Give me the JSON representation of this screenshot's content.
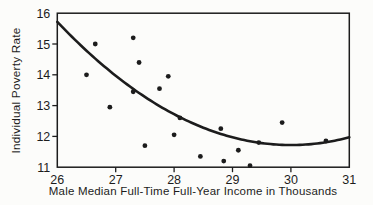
{
  "figure": {
    "background": "#fcfcfa",
    "ink": "#1c1c1c"
  },
  "chart_data": {
    "type": "scatter",
    "title": "",
    "xlabel": "Male Median Full-Time Full-Year Income in Thousands",
    "ylabel": "Individual Poverty Rate",
    "xlim": [
      26,
      31
    ],
    "ylim": [
      11,
      16
    ],
    "xticks": [
      26,
      27,
      28,
      29,
      30,
      31
    ],
    "yticks": [
      11,
      12,
      13,
      14,
      15,
      16
    ],
    "grid": false,
    "legend": null,
    "points": [
      [
        26.5,
        14.0
      ],
      [
        26.65,
        15.0
      ],
      [
        26.9,
        12.95
      ],
      [
        27.3,
        15.2
      ],
      [
        27.3,
        13.45
      ],
      [
        27.4,
        14.4
      ],
      [
        27.5,
        11.7
      ],
      [
        27.75,
        13.55
      ],
      [
        27.9,
        13.95
      ],
      [
        28.0,
        12.05
      ],
      [
        28.1,
        12.6
      ],
      [
        28.45,
        11.35
      ],
      [
        28.8,
        12.25
      ],
      [
        28.85,
        11.2
      ],
      [
        29.1,
        11.55
      ],
      [
        29.3,
        11.05
      ],
      [
        29.45,
        11.8
      ],
      [
        29.85,
        12.45
      ],
      [
        30.6,
        11.85
      ]
    ],
    "fit_curve": {
      "type": "quadratic",
      "description": "y = a*(x-h)^2 + k",
      "a": 0.25,
      "h": 30.0,
      "k": 11.72,
      "x_range": [
        26,
        31
      ]
    }
  }
}
